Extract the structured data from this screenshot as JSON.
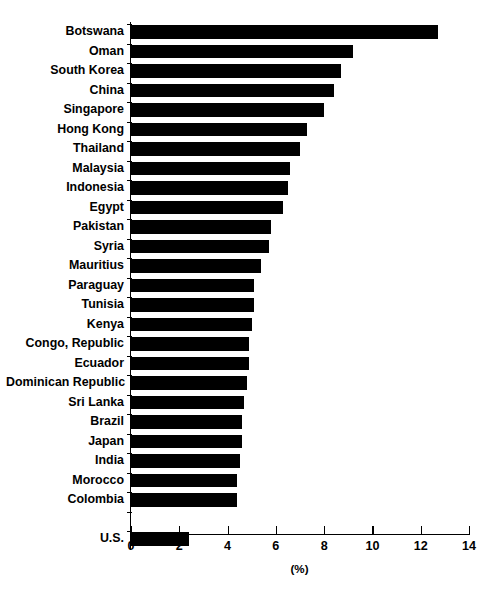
{
  "chart_data": {
    "type": "bar",
    "orientation": "horizontal",
    "title": "",
    "xlabel": "(%)",
    "ylabel": "",
    "xlim": [
      0,
      14
    ],
    "xticks": [
      0,
      2,
      4,
      6,
      8,
      10,
      12,
      14
    ],
    "xtick_labels": [
      "0",
      "2",
      "4",
      "6",
      "8",
      "10",
      "12",
      "14"
    ],
    "grid": false,
    "legend": null,
    "bar_color": "#000000",
    "categories": [
      "Botswana",
      "Oman",
      "South Korea",
      "China",
      "Singapore",
      "Hong Kong",
      "Thailand",
      "Malaysia",
      "Indonesia",
      "Egypt",
      "Pakistan",
      "Syria",
      "Mauritius",
      "Paraguay",
      "Tunisia",
      "Kenya",
      "Congo, Republic",
      "Ecuador",
      "Dominican Republic",
      "Sri Lanka",
      "Brazil",
      "Japan",
      "India",
      "Morocco",
      "Colombia",
      "",
      "U.S."
    ],
    "values": [
      12.7,
      9.2,
      8.7,
      8.4,
      8.0,
      7.3,
      7.0,
      6.6,
      6.5,
      6.3,
      5.8,
      5.7,
      5.4,
      5.1,
      5.1,
      5.0,
      4.9,
      4.9,
      4.8,
      4.7,
      4.6,
      4.6,
      4.5,
      4.4,
      4.4,
      null,
      2.4
    ]
  },
  "axis": {
    "x_title": "(%)"
  },
  "title_remnant": ""
}
